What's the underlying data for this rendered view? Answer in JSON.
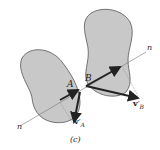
{
  "diagram": {
    "caption": "(c)",
    "colors": {
      "body_fill": "#c8c8c8",
      "body_stroke": "#555555",
      "arrow": "#222222",
      "line": "#777777"
    },
    "bodies": [
      {
        "name": "body-A",
        "point_label": "A"
      },
      {
        "name": "body-B",
        "point_label": "B"
      }
    ],
    "normal_line_labels": {
      "left": "n",
      "right": "n"
    },
    "velocity_labels": {
      "A": {
        "main": "v",
        "prime": "′",
        "sub": "A"
      },
      "B": {
        "main": "v",
        "prime": "′",
        "sub": "B"
      }
    }
  }
}
